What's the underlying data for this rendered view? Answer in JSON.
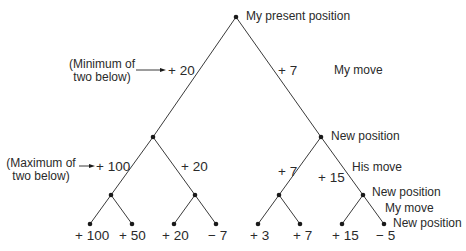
{
  "diagram": {
    "type": "game-tree",
    "root": {
      "label": "My present position"
    },
    "level_labels": {
      "my_move_top": "My move",
      "new_position_1": "New position",
      "his_move": "His move",
      "new_position_2": "New position",
      "my_move_bottom": "My move",
      "new_position_3": "New position"
    },
    "annotations": {
      "minimum": {
        "line1": "(Minimum of",
        "line2": "two below)"
      },
      "maximum": {
        "line1": "(Maximum of",
        "line2": "two below)"
      }
    },
    "values": {
      "level1": [
        "+ 20",
        "+ 7"
      ],
      "level2": [
        "+ 100",
        "+ 20",
        "+ 7",
        "+ 15"
      ],
      "leaves": [
        "+ 100",
        "+ 50",
        "+ 20",
        "− 7",
        "+ 3",
        "+ 7",
        "+ 15",
        "− 5"
      ]
    },
    "colors": {
      "line": "#3a3a3a",
      "node": "#1a1a1a",
      "text": "#2a2a2a"
    }
  }
}
